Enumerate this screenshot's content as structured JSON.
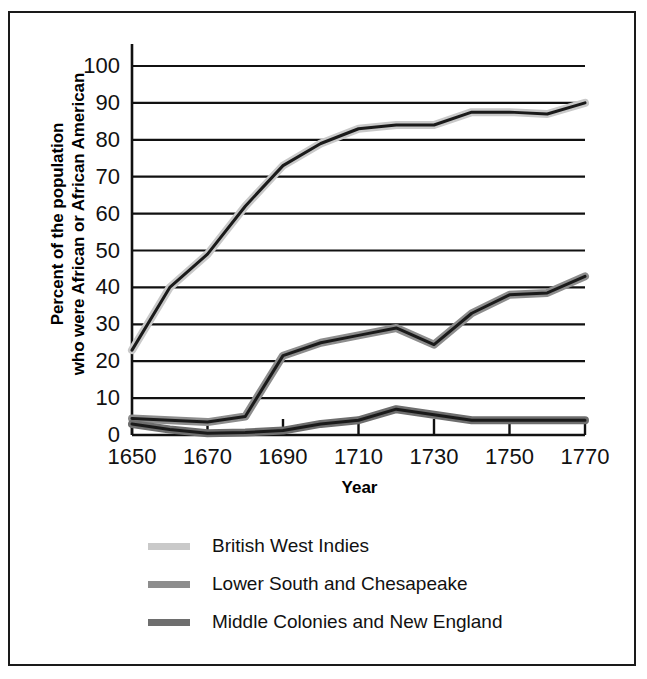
{
  "chart_data": {
    "type": "line",
    "title": "",
    "xlabel": "Year",
    "ylabel_line1": "Percent of the population",
    "ylabel_line2": "who were African or African American",
    "xlim": [
      1650,
      1770
    ],
    "ylim": [
      0,
      100
    ],
    "grid": true,
    "legend_position": "below",
    "x_ticks": [
      "1650",
      "1670",
      "1690",
      "1710",
      "1730",
      "1750",
      "1770"
    ],
    "y_ticks": [
      "0",
      "10",
      "20",
      "30",
      "40",
      "50",
      "60",
      "70",
      "80",
      "90",
      "100"
    ],
    "x": [
      1650,
      1660,
      1670,
      1680,
      1690,
      1700,
      1710,
      1720,
      1730,
      1740,
      1750,
      1760,
      1770
    ],
    "series": [
      {
        "name": "British West Indies",
        "color": "#c9c9c9",
        "outline": "#1a1a1a",
        "values": [
          23,
          40,
          49,
          62,
          73,
          79,
          83,
          84,
          84,
          87.5,
          87.5,
          87,
          90
        ]
      },
      {
        "name": "Lower South and Chesapeake",
        "color": "#8d8d8d",
        "outline": "#1a1a1a",
        "values": [
          4.5,
          4,
          3.5,
          5,
          21.5,
          25,
          27,
          29,
          24.5,
          33,
          38,
          38.5,
          43
        ]
      },
      {
        "name": "Middle Colonies and New England",
        "color": "#6e6e6e",
        "outline": "#1a1a1a",
        "values": [
          3,
          1.5,
          0.5,
          0.7,
          1.2,
          3,
          4,
          7,
          5.5,
          4,
          4,
          4,
          4
        ]
      }
    ]
  },
  "legend": {
    "items": [
      {
        "label": "British West Indies",
        "color": "#c9c9c9"
      },
      {
        "label": "Lower South and Chesapeake",
        "color": "#8d8d8d"
      },
      {
        "label": "Middle Colonies and New England",
        "color": "#6e6e6e"
      }
    ]
  }
}
